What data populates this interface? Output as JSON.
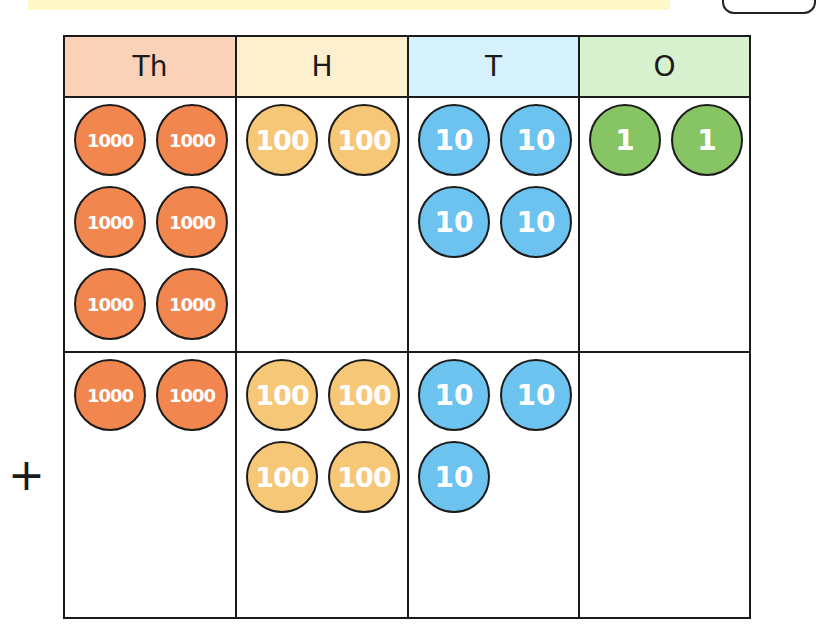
{
  "colors": {
    "thousands_header": "#f9d2b7",
    "hundreds_header": "#fdf0cf",
    "tens_header": "#d5f1fb",
    "ones_header": "#d7f0cd",
    "thousands_coin": "#f2864f",
    "hundreds_coin": "#f7c778",
    "tens_coin": "#6cc3ef",
    "ones_coin": "#86c464",
    "border": "#1b1b1b"
  },
  "operator": "+",
  "table": {
    "headers": [
      {
        "label": "Th",
        "key": "thousands"
      },
      {
        "label": "H",
        "key": "hundreds"
      },
      {
        "label": "T",
        "key": "tens"
      },
      {
        "label": "O",
        "key": "ones"
      }
    ],
    "rows": [
      {
        "name": "first-addend",
        "thousands": [
          "1000",
          "1000",
          "1000",
          "1000",
          "1000",
          "1000"
        ],
        "hundreds": [
          "100",
          "100"
        ],
        "tens": [
          "10",
          "10",
          "10",
          "10"
        ],
        "ones": [
          "1",
          "1"
        ]
      },
      {
        "name": "second-addend",
        "thousands": [
          "1000",
          "1000"
        ],
        "hundreds": [
          "100",
          "100",
          "100",
          "100"
        ],
        "tens": [
          "10",
          "10",
          "10"
        ],
        "ones": []
      }
    ]
  }
}
